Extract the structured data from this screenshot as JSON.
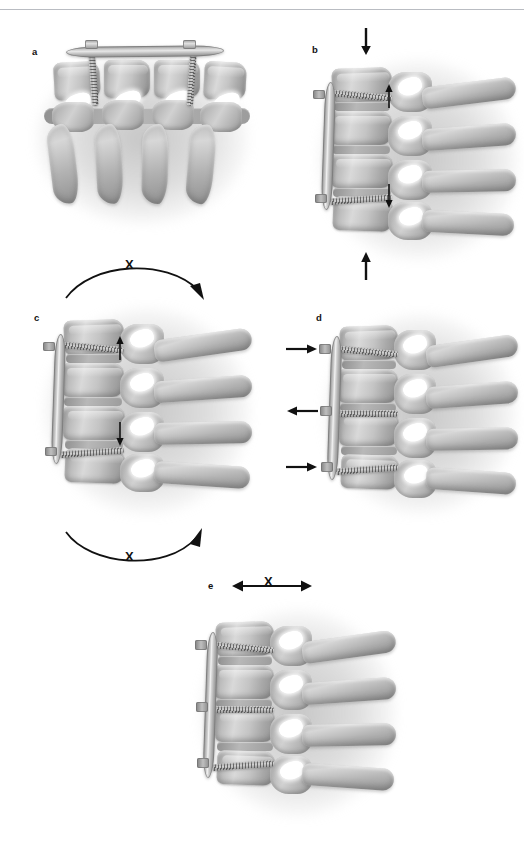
{
  "figure": {
    "kind": "medical-illustration",
    "background_color": "#ffffff",
    "ink_color": "#111111",
    "bone_color": "#b6b8bc",
    "hardware_color": "#c8cace",
    "rendering": "grayscale airbrush medical illustration"
  },
  "header": {
    "rule_color": "#b9bcc2",
    "text": ""
  },
  "panels": [
    {
      "id": "a",
      "label": "a",
      "view": "anteroposterior",
      "description": "Anterior view of cervical spine with horizontal anterior plate secured by two screws into the vertebral bodies",
      "hardware": {
        "plate": "horizontal anterior cervical plate",
        "screw_count": 2
      },
      "annotations": []
    },
    {
      "id": "b",
      "label": "b",
      "view": "lateral",
      "description": "Lateral view with vertical anterior plate and two screws; axial compressive loading applied",
      "hardware": {
        "plate": "vertical anterior cervical plate",
        "screw_count": 2
      },
      "annotations": [
        {
          "name": "axial-load-arrow-top",
          "glyph": "arrow",
          "direction": "down",
          "position": "above specimen"
        },
        {
          "name": "axial-load-arrow-bottom",
          "glyph": "arrow",
          "direction": "up",
          "position": "below specimen"
        },
        {
          "name": "segment-motion-arrow-upper",
          "glyph": "arrow",
          "direction": "up",
          "position": "upper disc space"
        },
        {
          "name": "segment-motion-arrow-lower",
          "glyph": "arrow",
          "direction": "down",
          "position": "lower disc space"
        }
      ]
    },
    {
      "id": "c",
      "label": "c",
      "view": "lateral",
      "description": "Lateral view with vertical anterior plate and two screws; flexion moment applied, motion blocked",
      "hardware": {
        "plate": "vertical anterior cervical plate",
        "screw_count": 2
      },
      "annotations": [
        {
          "name": "flexion-arc-arrow",
          "glyph": "curved-arrow",
          "direction": "clockwise-downward",
          "blocked": true,
          "blocked_marker": "X"
        },
        {
          "name": "extension-arc-arrow",
          "glyph": "curved-arrow",
          "direction": "counterclockwise-upward",
          "blocked": true,
          "blocked_marker": "X"
        },
        {
          "name": "segment-motion-arrow-upper",
          "glyph": "arrow",
          "direction": "up",
          "position": "upper disc space"
        },
        {
          "name": "segment-motion-arrow-lower",
          "glyph": "arrow",
          "direction": "down",
          "position": "lower disc space"
        }
      ]
    },
    {
      "id": "d",
      "label": "d",
      "view": "lateral",
      "description": "Lateral view with vertical anterior plate and three screws; alternating anteroposterior shear forces at each screw level",
      "hardware": {
        "plate": "vertical anterior cervical plate",
        "screw_count": 3
      },
      "annotations": [
        {
          "name": "shear-arrow-upper",
          "glyph": "arrow",
          "direction": "right",
          "position": "upper screw level"
        },
        {
          "name": "shear-arrow-middle",
          "glyph": "arrow",
          "direction": "left",
          "position": "middle screw level"
        },
        {
          "name": "shear-arrow-lower",
          "glyph": "arrow",
          "direction": "right",
          "position": "lower screw level"
        }
      ]
    },
    {
      "id": "e",
      "label": "e",
      "view": "lateral",
      "description": "Lateral view with vertical anterior plate and three screws; translation blocked",
      "hardware": {
        "plate": "vertical anterior cervical plate",
        "screw_count": 3
      },
      "annotations": [
        {
          "name": "translation-arrow",
          "glyph": "double-headed-arrow",
          "direction": "horizontal",
          "blocked": true,
          "blocked_marker": "X"
        }
      ]
    }
  ],
  "markers": {
    "blocked_symbol": "X"
  }
}
